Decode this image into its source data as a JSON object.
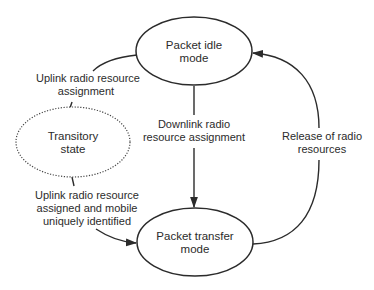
{
  "diagram": {
    "title": "",
    "nodes": [
      {
        "id": "idle",
        "label_lines": [
          "Packet idle",
          "mode"
        ],
        "style": "solid"
      },
      {
        "id": "transitory",
        "label_lines": [
          "Transitory",
          "state"
        ],
        "style": "dotted"
      },
      {
        "id": "transfer",
        "label_lines": [
          "Packet transfer",
          "mode"
        ],
        "style": "solid"
      }
    ],
    "edges": [
      {
        "id": "uplink-assignment",
        "from": "idle",
        "to": "transitory",
        "label_lines": [
          "Uplink radio resource",
          "assignment"
        ]
      },
      {
        "id": "uplink-assigned",
        "from": "transitory",
        "to": "transfer",
        "label_lines": [
          "Uplink radio resource",
          "assigned and mobile",
          "uniquely identified"
        ]
      },
      {
        "id": "downlink-assignment",
        "from": "idle",
        "to": "transfer",
        "label_lines": [
          "Downlink radio",
          "resource assignment"
        ]
      },
      {
        "id": "release",
        "from": "transfer",
        "to": "idle",
        "label_lines": [
          "Release of radio",
          "resources"
        ]
      }
    ],
    "colors": {
      "stroke": "#2b2b2b",
      "background": "#ffffff"
    }
  },
  "n": {
    "idle": {
      "l1": "Packet idle",
      "l2": "mode"
    },
    "transitory": {
      "l1": "Transitory",
      "l2": "state"
    },
    "transfer": {
      "l1": "Packet transfer",
      "l2": "mode"
    }
  },
  "e": {
    "uplink_assignment": {
      "l1": "Uplink radio resource",
      "l2": "assignment"
    },
    "uplink_assigned": {
      "l1": "Uplink radio resource",
      "l2": "assigned and mobile",
      "l3": "uniquely identified"
    },
    "downlink": {
      "l1": "Downlink radio",
      "l2": "resource assignment"
    },
    "release": {
      "l1": "Release of radio",
      "l2": "resources"
    }
  }
}
